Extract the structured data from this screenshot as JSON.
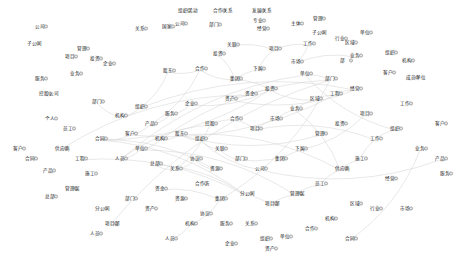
{
  "graph": {
    "type": "network",
    "background": "#ffffff",
    "node_fill": "#e6e6e6",
    "node_stroke": "#7a7a7a",
    "edge_color": "#d8d8d8",
    "label_color": "#222222",
    "nodes": [
      {
        "x": 140,
        "y": 30,
        "label": "关系"
      },
      {
        "x": 167,
        "y": 28,
        "label": "国家"
      },
      {
        "x": 183,
        "y": 12,
        "label": "组织活动"
      },
      {
        "x": 218,
        "y": 12,
        "label": "合作关系"
      },
      {
        "x": 257,
        "y": 12,
        "label": "发展关系"
      },
      {
        "x": 258,
        "y": 22,
        "label": "专业"
      },
      {
        "x": 180,
        "y": 25,
        "label": "公司"
      },
      {
        "x": 214,
        "y": 26,
        "label": "部门"
      },
      {
        "x": 262,
        "y": 30,
        "label": "经营"
      },
      {
        "x": 296,
        "y": 25,
        "label": "主体"
      },
      {
        "x": 318,
        "y": 20,
        "label": "管理"
      },
      {
        "x": 317,
        "y": 34,
        "label": "子公司"
      },
      {
        "x": 340,
        "y": 40,
        "label": "行业"
      },
      {
        "x": 350,
        "y": 44,
        "label": "区域"
      },
      {
        "x": 365,
        "y": 34,
        "label": "单位"
      },
      {
        "x": 390,
        "y": 54,
        "label": "组织"
      },
      {
        "x": 407,
        "y": 62,
        "label": "机构"
      },
      {
        "x": 411,
        "y": 79,
        "label": "成员单位"
      },
      {
        "x": 388,
        "y": 74,
        "label": "客户"
      },
      {
        "x": 355,
        "y": 57,
        "label": "业务"
      },
      {
        "x": 345,
        "y": 62,
        "label": "部"
      },
      {
        "x": 308,
        "y": 45,
        "label": "工作"
      },
      {
        "x": 296,
        "y": 63,
        "label": "市场"
      },
      {
        "x": 274,
        "y": 50,
        "label": "项目"
      },
      {
        "x": 258,
        "y": 70,
        "label": "下属"
      },
      {
        "x": 235,
        "y": 80,
        "label": "集团"
      },
      {
        "x": 232,
        "y": 46,
        "label": "关联"
      },
      {
        "x": 200,
        "y": 70,
        "label": "合作"
      },
      {
        "x": 218,
        "y": 55,
        "label": "投资"
      },
      {
        "x": 168,
        "y": 72,
        "label": "股东"
      },
      {
        "x": 40,
        "y": 28,
        "label": "公司"
      },
      {
        "x": 32,
        "y": 45,
        "label": "子公司"
      },
      {
        "x": 70,
        "y": 58,
        "label": "项目"
      },
      {
        "x": 82,
        "y": 50,
        "label": "管理"
      },
      {
        "x": 95,
        "y": 60,
        "label": "投资"
      },
      {
        "x": 108,
        "y": 65,
        "label": "企业"
      },
      {
        "x": 75,
        "y": 75,
        "label": "业务"
      },
      {
        "x": 40,
        "y": 80,
        "label": "服务"
      },
      {
        "x": 44,
        "y": 95,
        "label": "控股公司"
      },
      {
        "x": 97,
        "y": 103,
        "label": "部门"
      },
      {
        "x": 120,
        "y": 117,
        "label": "机构"
      },
      {
        "x": 140,
        "y": 108,
        "label": "组织"
      },
      {
        "x": 50,
        "y": 120,
        "label": "个人"
      },
      {
        "x": 68,
        "y": 130,
        "label": "员工"
      },
      {
        "x": 18,
        "y": 150,
        "label": "客户"
      },
      {
        "x": 60,
        "y": 150,
        "label": "供应商"
      },
      {
        "x": 30,
        "y": 160,
        "label": "合同"
      },
      {
        "x": 48,
        "y": 172,
        "label": "产品"
      },
      {
        "x": 80,
        "y": 160,
        "label": "工程"
      },
      {
        "x": 90,
        "y": 175,
        "label": "施工"
      },
      {
        "x": 70,
        "y": 190,
        "label": "管理层"
      },
      {
        "x": 50,
        "y": 198,
        "label": "总部"
      },
      {
        "x": 100,
        "y": 210,
        "label": "分公司"
      },
      {
        "x": 110,
        "y": 225,
        "label": "项目部"
      },
      {
        "x": 95,
        "y": 235,
        "label": "人员"
      },
      {
        "x": 130,
        "y": 200,
        "label": "部门"
      },
      {
        "x": 150,
        "y": 210,
        "label": "资产"
      },
      {
        "x": 160,
        "y": 190,
        "label": "资金"
      },
      {
        "x": 180,
        "y": 200,
        "label": "资源"
      },
      {
        "x": 200,
        "y": 185,
        "label": "合作方"
      },
      {
        "x": 205,
        "y": 215,
        "label": "协议"
      },
      {
        "x": 225,
        "y": 225,
        "label": "服务"
      },
      {
        "x": 250,
        "y": 225,
        "label": "关系"
      },
      {
        "x": 230,
        "y": 245,
        "label": "企业"
      },
      {
        "x": 265,
        "y": 240,
        "label": "组织"
      },
      {
        "x": 285,
        "y": 238,
        "label": "单位"
      },
      {
        "x": 310,
        "y": 230,
        "label": "合作"
      },
      {
        "x": 330,
        "y": 220,
        "label": "机构"
      },
      {
        "x": 355,
        "y": 205,
        "label": "区域"
      },
      {
        "x": 375,
        "y": 210,
        "label": "行业"
      },
      {
        "x": 405,
        "y": 210,
        "label": "市场"
      },
      {
        "x": 390,
        "y": 180,
        "label": "经营"
      },
      {
        "x": 420,
        "y": 150,
        "label": "业务"
      },
      {
        "x": 440,
        "y": 125,
        "label": "客户"
      },
      {
        "x": 440,
        "y": 160,
        "label": "产品"
      },
      {
        "x": 445,
        "y": 175,
        "label": "服务"
      },
      {
        "x": 405,
        "y": 105,
        "label": "工作"
      },
      {
        "x": 365,
        "y": 115,
        "label": "项目"
      },
      {
        "x": 340,
        "y": 125,
        "label": "投资"
      },
      {
        "x": 320,
        "y": 135,
        "label": "管理"
      },
      {
        "x": 300,
        "y": 150,
        "label": "下属"
      },
      {
        "x": 280,
        "y": 160,
        "label": "集团"
      },
      {
        "x": 260,
        "y": 170,
        "label": "公司"
      },
      {
        "x": 240,
        "y": 160,
        "label": "部门"
      },
      {
        "x": 220,
        "y": 150,
        "label": "关联"
      },
      {
        "x": 200,
        "y": 140,
        "label": "组织"
      },
      {
        "x": 180,
        "y": 135,
        "label": "股东"
      },
      {
        "x": 160,
        "y": 140,
        "label": "机构"
      },
      {
        "x": 140,
        "y": 150,
        "label": "单位"
      },
      {
        "x": 120,
        "y": 160,
        "label": "人员"
      },
      {
        "x": 210,
        "y": 125,
        "label": "控股"
      },
      {
        "x": 235,
        "y": 120,
        "label": "合作"
      },
      {
        "x": 255,
        "y": 130,
        "label": "项目"
      },
      {
        "x": 275,
        "y": 120,
        "label": "市场"
      },
      {
        "x": 295,
        "y": 110,
        "label": "业务"
      },
      {
        "x": 315,
        "y": 100,
        "label": "区域"
      },
      {
        "x": 335,
        "y": 95,
        "label": "工程"
      },
      {
        "x": 355,
        "y": 90,
        "label": "经营"
      },
      {
        "x": 230,
        "y": 100,
        "label": "资产"
      },
      {
        "x": 250,
        "y": 95,
        "label": "资金"
      },
      {
        "x": 270,
        "y": 90,
        "label": "投资"
      },
      {
        "x": 190,
        "y": 105,
        "label": "企业"
      },
      {
        "x": 170,
        "y": 115,
        "label": "服务"
      },
      {
        "x": 150,
        "y": 125,
        "label": "产品"
      },
      {
        "x": 130,
        "y": 135,
        "label": "客户"
      },
      {
        "x": 100,
        "y": 140,
        "label": "合同"
      },
      {
        "x": 215,
        "y": 170,
        "label": "资源"
      },
      {
        "x": 195,
        "y": 160,
        "label": "协议"
      },
      {
        "x": 175,
        "y": 170,
        "label": "关系"
      },
      {
        "x": 155,
        "y": 165,
        "label": "总部"
      },
      {
        "x": 245,
        "y": 195,
        "label": "分公司"
      },
      {
        "x": 270,
        "y": 205,
        "label": "项目部"
      },
      {
        "x": 295,
        "y": 195,
        "label": "管理层"
      },
      {
        "x": 320,
        "y": 185,
        "label": "员工"
      },
      {
        "x": 340,
        "y": 170,
        "label": "供应商"
      },
      {
        "x": 360,
        "y": 160,
        "label": "施工"
      },
      {
        "x": 375,
        "y": 140,
        "label": "工作"
      },
      {
        "x": 395,
        "y": 130,
        "label": "组织"
      },
      {
        "x": 305,
        "y": 75,
        "label": "单位"
      },
      {
        "x": 330,
        "y": 80,
        "label": "部门"
      },
      {
        "x": 220,
        "y": 200,
        "label": "集团"
      },
      {
        "x": 190,
        "y": 225,
        "label": "机构"
      },
      {
        "x": 170,
        "y": 240,
        "label": "人员"
      },
      {
        "x": 270,
        "y": 250,
        "label": "资产"
      },
      {
        "x": 350,
        "y": 240,
        "label": "合同"
      }
    ],
    "edges": [
      [
        25,
        27
      ],
      [
        27,
        29
      ],
      [
        29,
        41
      ],
      [
        41,
        40
      ],
      [
        40,
        39
      ],
      [
        25,
        24
      ],
      [
        24,
        23
      ],
      [
        23,
        21
      ],
      [
        21,
        22
      ],
      [
        84,
        85
      ],
      [
        85,
        86
      ],
      [
        86,
        87
      ],
      [
        87,
        88
      ],
      [
        88,
        89
      ],
      [
        89,
        90
      ],
      [
        90,
        91
      ],
      [
        91,
        92
      ],
      [
        92,
        93
      ],
      [
        93,
        94
      ],
      [
        94,
        95
      ],
      [
        95,
        96
      ],
      [
        96,
        97
      ],
      [
        97,
        98
      ],
      [
        98,
        99
      ],
      [
        99,
        100
      ],
      [
        100,
        101
      ],
      [
        101,
        102
      ],
      [
        102,
        103
      ],
      [
        103,
        104
      ],
      [
        104,
        105
      ],
      [
        105,
        106
      ],
      [
        106,
        107
      ],
      [
        107,
        108
      ],
      [
        108,
        109
      ],
      [
        109,
        110
      ],
      [
        110,
        111
      ],
      [
        111,
        112
      ],
      [
        112,
        113
      ],
      [
        113,
        114
      ],
      [
        114,
        115
      ],
      [
        115,
        116
      ],
      [
        116,
        117
      ],
      [
        117,
        118
      ],
      [
        118,
        119
      ],
      [
        119,
        120
      ],
      [
        120,
        121
      ],
      [
        121,
        122
      ],
      [
        95,
        100
      ],
      [
        100,
        105
      ],
      [
        105,
        110
      ],
      [
        86,
        114
      ],
      [
        88,
        112
      ],
      [
        90,
        108
      ],
      [
        25,
        100
      ],
      [
        27,
        103
      ],
      [
        41,
        97
      ],
      [
        45,
        99
      ],
      [
        48,
        110
      ],
      [
        53,
        119
      ],
      [
        57,
        120
      ],
      [
        60,
        127
      ],
      [
        63,
        128
      ],
      [
        65,
        129
      ],
      [
        69,
        125
      ],
      [
        72,
        124
      ],
      [
        74,
        82
      ],
      [
        77,
        80
      ],
      [
        80,
        83
      ],
      [
        83,
        84
      ],
      [
        82,
        85
      ],
      [
        79,
        86
      ],
      [
        96,
        104
      ],
      [
        94,
        114
      ],
      [
        92,
        116
      ],
      [
        89,
        118
      ],
      [
        87,
        119
      ],
      [
        28,
        25
      ],
      [
        26,
        23
      ],
      [
        22,
        19
      ]
    ]
  }
}
